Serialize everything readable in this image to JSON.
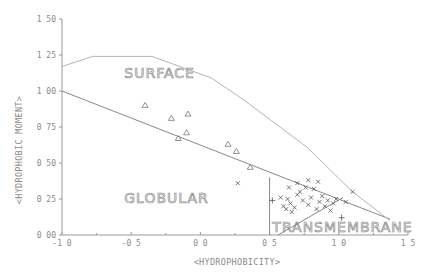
{
  "chart_data": {
    "type": "scatter",
    "title": "",
    "xlabel": "<HYDROPHOBICITY>",
    "ylabel": "<HYDROPHOBIC MOMENT>",
    "xlim": [
      -1.0,
      1.5
    ],
    "ylim": [
      0.0,
      1.5
    ],
    "grid": false,
    "x_ticks": [
      "-1 0",
      "-0 5",
      "0 0",
      "0 5",
      "1 0",
      "1 5"
    ],
    "x_tick_values": [
      -1.0,
      -0.5,
      0.0,
      0.5,
      1.0,
      1.5
    ],
    "y_ticks": [
      "0 00",
      "0 25",
      "0 50",
      "0 75",
      "1 00",
      "1 25",
      "1 50"
    ],
    "y_tick_values": [
      0.0,
      0.25,
      0.5,
      0.75,
      1.0,
      1.25,
      1.5
    ],
    "region_labels": [
      {
        "text": "SURFACE",
        "x": -0.55,
        "y": 1.09
      },
      {
        "text": "GLOBULAR",
        "x": -0.55,
        "y": 0.22
      },
      {
        "text": "TRANSMEMBRANE",
        "x": 0.52,
        "y": 0.02
      }
    ],
    "boundaries": [
      {
        "name": "surface-globular-line",
        "points": [
          [
            -1.0,
            1.0
          ],
          [
            1.37,
            0.11
          ]
        ]
      },
      {
        "name": "upper-envelope-curve",
        "points": [
          [
            -1.0,
            1.17
          ],
          [
            -0.78,
            1.24
          ],
          [
            -0.35,
            1.24
          ],
          [
            0.08,
            1.09
          ],
          [
            0.31,
            0.94
          ],
          [
            0.77,
            0.61
          ],
          [
            1.1,
            0.3
          ],
          [
            1.37,
            0.1
          ]
        ]
      },
      {
        "name": "transmembrane-vertical",
        "points": [
          [
            0.5,
            0.0
          ],
          [
            0.5,
            0.4
          ]
        ]
      },
      {
        "name": "transmembrane-diagonal",
        "points": [
          [
            0.56,
            0.0
          ],
          [
            1.03,
            0.26
          ]
        ]
      }
    ],
    "series": [
      {
        "name": "triangles",
        "marker": "triangle",
        "points": [
          [
            -0.4,
            0.9
          ],
          [
            -0.21,
            0.81
          ],
          [
            -0.09,
            0.84
          ],
          [
            -0.1,
            0.71
          ],
          [
            -0.16,
            0.67
          ],
          [
            0.2,
            0.63
          ],
          [
            0.26,
            0.58
          ],
          [
            0.36,
            0.47
          ]
        ]
      },
      {
        "name": "crosses-transmembrane",
        "marker": "x",
        "points": [
          [
            0.27,
            0.36
          ],
          [
            0.58,
            0.26
          ],
          [
            0.6,
            0.2
          ],
          [
            0.62,
            0.18
          ],
          [
            0.63,
            0.25
          ],
          [
            0.65,
            0.22
          ],
          [
            0.66,
            0.16
          ],
          [
            0.68,
            0.19
          ],
          [
            0.7,
            0.28
          ],
          [
            0.72,
            0.3
          ],
          [
            0.74,
            0.24
          ],
          [
            0.76,
            0.33
          ],
          [
            0.78,
            0.21
          ],
          [
            0.8,
            0.26
          ],
          [
            0.82,
            0.32
          ],
          [
            0.84,
            0.18
          ],
          [
            0.86,
            0.23
          ],
          [
            0.88,
            0.27
          ],
          [
            0.9,
            0.2
          ],
          [
            0.92,
            0.24
          ],
          [
            0.94,
            0.17
          ],
          [
            0.96,
            0.22
          ],
          [
            0.98,
            0.25
          ],
          [
            0.7,
            0.36
          ],
          [
            0.64,
            0.33
          ],
          [
            0.85,
            0.37
          ],
          [
            0.78,
            0.38
          ],
          [
            1.05,
            0.23
          ],
          [
            1.1,
            0.3
          ]
        ]
      },
      {
        "name": "plus",
        "marker": "plus",
        "points": [
          [
            1.02,
            0.12
          ],
          [
            0.52,
            0.24
          ]
        ]
      }
    ]
  }
}
